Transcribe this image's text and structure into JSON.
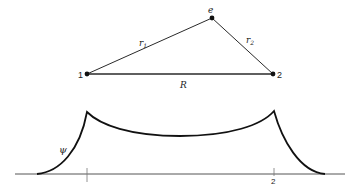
{
  "diagram": {
    "triangle": {
      "vertices": [
        {
          "id": "1",
          "label": "1",
          "x": 87,
          "y": 74
        },
        {
          "id": "2",
          "label": "2",
          "x": 273,
          "y": 74
        },
        {
          "id": "e",
          "label": "e",
          "x": 212,
          "y": 18
        }
      ],
      "edges": [
        {
          "from": "1",
          "to": "e",
          "label": "r1",
          "label_main": "r",
          "label_sub": "1"
        },
        {
          "from": "e",
          "to": "2",
          "label": "r2",
          "label_main": "r",
          "label_sub": "2"
        },
        {
          "from": "1",
          "to": "2",
          "label": "R"
        }
      ]
    },
    "wavefunction": {
      "label": "ψ",
      "axis_ticks": [
        {
          "label": "1",
          "x": 87
        },
        {
          "label": "2",
          "x": 273
        }
      ]
    }
  }
}
